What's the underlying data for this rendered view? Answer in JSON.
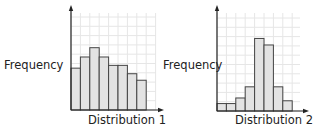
{
  "chart_data": [
    {
      "type": "bar",
      "title": "",
      "xlabel": "Distribution 1",
      "ylabel": "Frequency",
      "categories": [
        "1",
        "2",
        "3",
        "4",
        "5",
        "6",
        "7",
        "8"
      ],
      "values": [
        4.5,
        5.7,
        6.7,
        5.7,
        4.8,
        4.8,
        3.9,
        3.2
      ],
      "ylim": [
        0,
        11
      ],
      "grid": true,
      "legend": "none",
      "shape": "skewed right / roughly uniform-decreasing"
    },
    {
      "type": "bar",
      "title": "",
      "xlabel": "Distribution 2",
      "ylabel": "Frequency",
      "categories": [
        "1",
        "2",
        "3",
        "4",
        "5",
        "6",
        "7",
        "8"
      ],
      "values": [
        0.8,
        0.8,
        1.4,
        2.6,
        7.8,
        7.1,
        2.6,
        1.1
      ],
      "ylim": [
        0,
        11
      ],
      "grid": true,
      "legend": "none",
      "shape": "peaked / mound-shaped"
    }
  ],
  "labels": {
    "chart1_ylabel": "Frequency",
    "chart1_xlabel": "Distribution 1",
    "chart2_ylabel": "Frequency",
    "chart2_xlabel": "Distribution 2"
  },
  "colors": {
    "bar_fill": "#e3e3e3",
    "bar_stroke": "#444444",
    "axis": "#222222",
    "grid": "#e6e6e6"
  }
}
